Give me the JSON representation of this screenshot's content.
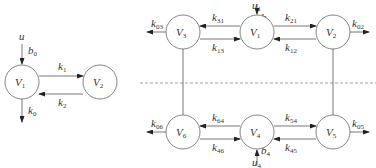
{
  "left_diagram": {
    "nodes": [
      {
        "id": "V1",
        "base": "V",
        "sub": "1",
        "cx": 22,
        "cy": 82
      },
      {
        "id": "V2",
        "base": "V",
        "sub": "2",
        "cx": 100,
        "cy": 82
      }
    ],
    "input": {
      "base": "u",
      "sub": ""
    },
    "input_gain": {
      "base": "b",
      "sub": "0"
    },
    "edges": [
      {
        "base": "k",
        "sub": "1",
        "from": "V1",
        "to": "V2"
      },
      {
        "base": "k",
        "sub": "2",
        "from": "V2",
        "to": "V1"
      }
    ],
    "outflow": {
      "base": "k",
      "sub": "0"
    }
  },
  "right_diagram": {
    "nodes": [
      {
        "id": "V3",
        "base": "V",
        "sub": "3",
        "cx": 183,
        "cy": 32
      },
      {
        "id": "V1",
        "base": "V",
        "sub": "1",
        "cx": 257,
        "cy": 32
      },
      {
        "id": "V2",
        "base": "V",
        "sub": "2",
        "cx": 333,
        "cy": 32
      },
      {
        "id": "V6",
        "base": "V",
        "sub": "6",
        "cx": 183,
        "cy": 132
      },
      {
        "id": "V4",
        "base": "V",
        "sub": "4",
        "cx": 257,
        "cy": 132
      },
      {
        "id": "V5",
        "base": "V",
        "sub": "5",
        "cx": 333,
        "cy": 132
      }
    ],
    "inputs": [
      {
        "u": {
          "base": "u",
          "sub": "1"
        },
        "b": {
          "base": "b",
          "sub": "1"
        },
        "target": "V1"
      },
      {
        "u": {
          "base": "u",
          "sub": "4"
        },
        "b": {
          "base": "b",
          "sub": "4"
        },
        "target": "V4"
      }
    ],
    "edges": [
      {
        "base": "k",
        "sub": "31",
        "from": "V1",
        "to": "V3"
      },
      {
        "base": "k",
        "sub": "13",
        "from": "V3",
        "to": "V1"
      },
      {
        "base": "k",
        "sub": "21",
        "from": "V1",
        "to": "V2"
      },
      {
        "base": "k",
        "sub": "12",
        "from": "V2",
        "to": "V1"
      },
      {
        "base": "k",
        "sub": "64",
        "from": "V4",
        "to": "V6"
      },
      {
        "base": "k",
        "sub": "46",
        "from": "V6",
        "to": "V4"
      },
      {
        "base": "k",
        "sub": "54",
        "from": "V4",
        "to": "V5"
      },
      {
        "base": "k",
        "sub": "45",
        "from": "V5",
        "to": "V4"
      }
    ],
    "outflows": [
      {
        "base": "k",
        "sub": "03",
        "node": "V3"
      },
      {
        "base": "k",
        "sub": "02",
        "node": "V2"
      },
      {
        "base": "k",
        "sub": "06",
        "node": "V6"
      },
      {
        "base": "k",
        "sub": "05",
        "node": "V5"
      }
    ],
    "separator": "dashed-line"
  }
}
